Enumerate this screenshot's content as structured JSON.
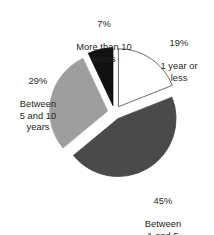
{
  "chart_data": {
    "type": "pie",
    "title": "",
    "subtitle": "",
    "xlabel": "",
    "ylabel": "",
    "legend_position": "none",
    "grid": false,
    "units": "percent",
    "total": 100,
    "start_angle_deg": 0,
    "direction": "clockwise",
    "exploded": true,
    "categories": [
      "1 year or less",
      "Between 1 and 5 years",
      "Between 5 and 10 years",
      "More than 10 years"
    ],
    "values": [
      19,
      45,
      29,
      7
    ],
    "slices": [
      {
        "id": "one-year-or-less",
        "percent_label": "19%",
        "value": 19,
        "label_lines": "1 year or\nless",
        "category": "1 year or less",
        "color": "#ffffff",
        "stroke": "#6d6e70",
        "start_deg": 0,
        "end_deg": 68.4
      },
      {
        "id": "one-to-five-years",
        "percent_label": "45%",
        "value": 45,
        "label_lines": "Between\n1 and 5\nyears",
        "category": "Between 1 and 5 years",
        "color": "#4a4a4a",
        "stroke": "#4a4a4a",
        "start_deg": 68.4,
        "end_deg": 230.4
      },
      {
        "id": "five-to-ten-years",
        "percent_label": "29%",
        "value": 29,
        "label_lines": "Between\n5 and 10\nyears",
        "category": "Between 5 and 10 years",
        "color": "#9e9e9e",
        "stroke": "#9e9e9e",
        "start_deg": 230.4,
        "end_deg": 334.8
      },
      {
        "id": "more-than-ten-years",
        "percent_label": "7%",
        "value": 7,
        "label_lines": "More than 10\nyears",
        "category": "More than 10 years",
        "color": "#111111",
        "stroke": "#111111",
        "start_deg": 334.8,
        "end_deg": 360
      }
    ],
    "colors": {
      "one_year_or_less": "#ffffff",
      "one_to_five_years": "#4a4a4a",
      "five_to_ten_years": "#9e9e9e",
      "more_than_ten_years": "#111111",
      "outline": "#6d6e70",
      "text": "#231f20",
      "background": "#ffffff"
    }
  }
}
